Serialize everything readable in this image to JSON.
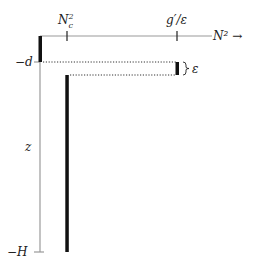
{
  "diagram": {
    "x_axis_label": "N² →",
    "y_axis_label": "z",
    "x_ticks": [
      {
        "label_base": "N",
        "label_sub": "c",
        "label_sup": "2",
        "text": "N_c²"
      },
      {
        "label": "g′/ε"
      }
    ],
    "y_ticks": [
      {
        "label": "−d"
      },
      {
        "label": "−H"
      }
    ],
    "brace_label": "ε",
    "colors": {
      "axis": "#9a9a9a",
      "profile": "#111111",
      "dotted": "#333333"
    }
  }
}
